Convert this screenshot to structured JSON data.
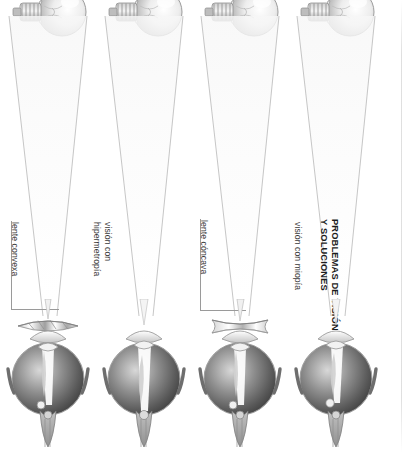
{
  "document": {
    "title": "PROBLEMAS DE VISIÓN\nY SOLUCIONES",
    "language": "es",
    "orientation": "rotated-90"
  },
  "panels": [
    {
      "id": "panel-lente-convexa",
      "label": "lente convexa",
      "has_corrective_lens": true,
      "lens_type": "convexa",
      "light_source": "bombilla",
      "has_bracket": true
    },
    {
      "id": "panel-vision-hipermetropia",
      "label": "visión con\nhipermetropía",
      "has_corrective_lens": false,
      "lens_type": "ninguna",
      "light_source": "bombilla",
      "has_bracket": false
    },
    {
      "id": "panel-lente-concava",
      "label": "lente cóncava",
      "has_corrective_lens": true,
      "lens_type": "cóncava",
      "light_source": "bombilla",
      "has_bracket": true
    },
    {
      "id": "panel-vision-miopia",
      "label": "visión con miopía",
      "has_corrective_lens": false,
      "lens_type": "ninguna",
      "light_source": "bombilla",
      "has_bracket": false
    }
  ],
  "icons": {
    "bulb": "light-bulb-icon",
    "eye": "eyeball-anatomy-icon",
    "cone": "light-ray-cone-icon",
    "lens": "corrective-lens-icon"
  },
  "colors": {
    "text": "#3a3a3a",
    "title_text": "#1c1c1c",
    "leader_line": "#9a9a9a",
    "ray_line": "#b4b4b4",
    "eye_dark": "#4a4a4a",
    "eye_light": "#e8e8e8",
    "background": "#ffffff"
  }
}
